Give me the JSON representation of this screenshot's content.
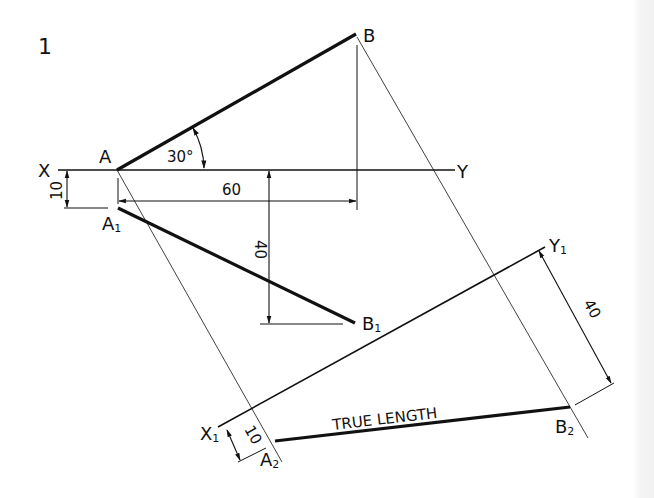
{
  "figure": {
    "number": "1",
    "colors": {
      "ink": "#111111",
      "paper": "#ffffff",
      "edge": "#f1f1f1"
    }
  },
  "labels": {
    "X": "X",
    "Y": "Y",
    "A": "A",
    "B": "B",
    "A1": "A",
    "A1_sub": "1",
    "B1": "B",
    "B1_sub": "1",
    "X1": "X",
    "X1_sub": "1",
    "Y1": "Y",
    "Y1_sub": "1",
    "A2": "A",
    "A2_sub": "2",
    "B2": "B",
    "B2_sub": "2"
  },
  "dimensions": {
    "angle": "30°",
    "length_xy": "60",
    "height_plan": "40",
    "offset_a": "10",
    "aux_height": "40",
    "aux_offset": "10"
  },
  "annotations": {
    "true_length": "TRUE LENGTH"
  }
}
